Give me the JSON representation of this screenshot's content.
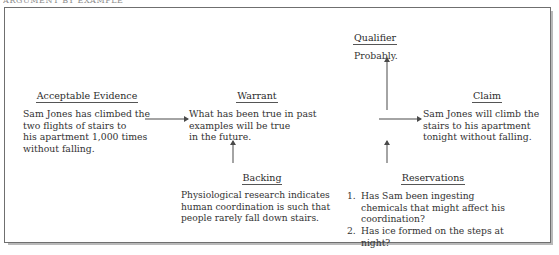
{
  "page": {
    "running_head": "ARGUMENT BY EXAMPLE"
  },
  "figure": {
    "nodes": {
      "evidence": {
        "title": "Acceptable Evidence",
        "body": "Sam Jones has climbed the\ntwo flights of stairs to\nhis apartment 1,000 times\nwithout falling."
      },
      "warrant": {
        "title": "Warrant",
        "body": "What has been true in past\nexamples will be true\nin the future."
      },
      "claim": {
        "title": "Claim",
        "body": "Sam Jones will climb the\nstairs to his apartment\ntonight without falling."
      },
      "qualifier": {
        "title": "Qualifier",
        "body": "Probably."
      },
      "backing": {
        "title": "Backing",
        "body": "Physiological research indicates\nhuman coordination is such that\npeople rarely fall down stairs."
      },
      "reservations": {
        "title": "Reservations",
        "items": [
          {
            "number": "1.",
            "text": "Has Sam been ingesting chemicals that might affect his coordination?"
          },
          {
            "number": "2.",
            "text": "Has ice formed on the steps at night?"
          }
        ]
      }
    },
    "arrows": [
      {
        "name": "evidence-to-warrant",
        "direction": "right"
      },
      {
        "name": "warrant-to-claim",
        "direction": "right"
      },
      {
        "name": "backing-to-warrant",
        "direction": "up"
      },
      {
        "name": "reservations-to-claim",
        "direction": "up"
      },
      {
        "name": "claim-to-qualifier",
        "direction": "up"
      }
    ]
  },
  "colors": {
    "ink": "#2b2b2b",
    "rule": "#555555",
    "frame": "#6f6f6f",
    "shadow": "#b9b9b9",
    "arrow": "#4a4a4a",
    "background": "#ffffff"
  }
}
